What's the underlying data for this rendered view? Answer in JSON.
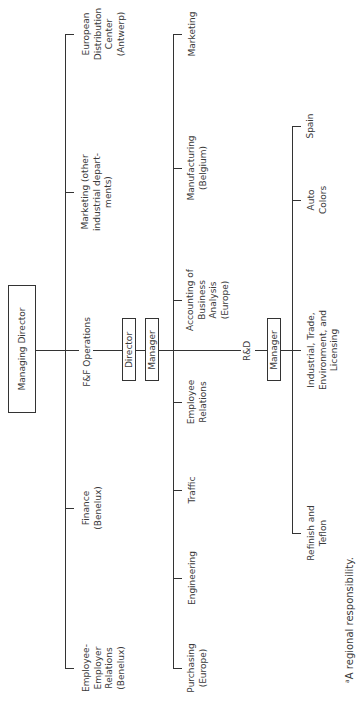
{
  "chart": {
    "orientation": "rotated-90-ccw",
    "root": {
      "label": "Managing Director"
    },
    "level1": {
      "line": "top-reports",
      "items": [
        {
          "label": "European\nDistribution\nCenter\n(Antwerp)"
        },
        {
          "label": "Marketing (other\nindustrial depart-\nments)"
        },
        {
          "label": "F&F Operations"
        },
        {
          "label": "Finance\n(Benelux)"
        },
        {
          "label": "Employee-\nEmployer\nRelations\n(Benelux)"
        }
      ]
    },
    "ff_operations": {
      "director_box": "Director",
      "manager_box": "Manager",
      "items": [
        {
          "label": "Marketing"
        },
        {
          "label": "Manufacturing\n(Belgium)",
          "footnote": "b"
        },
        {
          "label": "Accounting of\nBusiness\nAnalysis\n(Europe)",
          "footnote": "a"
        },
        {
          "label": "R&D"
        },
        {
          "label": "Employee\nRelations"
        },
        {
          "label": "Traffic"
        },
        {
          "label": "Engineering"
        },
        {
          "label": "Purchasing\n(Europe)",
          "footnote": "a"
        }
      ]
    },
    "rnd": {
      "manager_box": "Manager",
      "items": [
        {
          "label": "Spain",
          "footnote": "c"
        },
        {
          "label": "Auto\nColors"
        },
        {
          "label": "Industrial, Trade,\nEnvironment, and\nLicensing"
        },
        {
          "label": "Refinish and\nTeflon"
        }
      ]
    },
    "footnote": {
      "marker": "a",
      "text": "A regional responsibility."
    }
  }
}
